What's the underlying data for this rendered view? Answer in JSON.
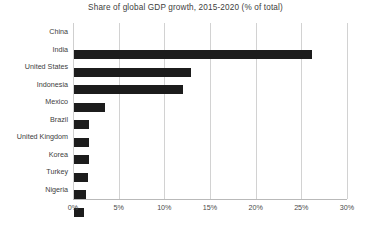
{
  "chart_data": {
    "type": "bar",
    "orientation": "horizontal",
    "title": "Share of global GDP growth, 2015-2020 (% of total)",
    "xlabel": "",
    "ylabel": "",
    "xlim": [
      0,
      30
    ],
    "xticks": [
      "0%",
      "5%",
      "10%",
      "15%",
      "20%",
      "25%",
      "30%"
    ],
    "xtick_values": [
      0,
      5,
      10,
      15,
      20,
      25,
      30
    ],
    "grid": "vertical",
    "legend": "none",
    "bar_color": "#1c1c1c",
    "categories": [
      "China",
      "India",
      "United States",
      "Indonesia",
      "Mexico",
      "Brazil",
      "United Kingdom",
      "Korea",
      "Turkey",
      "Nigeria"
    ],
    "values": [
      26.1,
      12.8,
      11.9,
      3.4,
      1.6,
      1.6,
      1.6,
      1.5,
      1.3,
      1.1
    ]
  }
}
